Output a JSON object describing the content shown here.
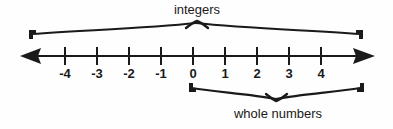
{
  "figure": {
    "title_top": "integers",
    "title_bottom": "whole numbers",
    "type": "number-line-diagram",
    "background_color": "#fefefe",
    "ink_color": "#1a1a1a"
  },
  "number_line": {
    "axis_y": 56,
    "left_arrow": "left-arrowhead",
    "right_arrow": "right-arrowhead",
    "ticks": [
      {
        "label": "-4",
        "value": -4,
        "x": 65
      },
      {
        "label": "-3",
        "value": -3,
        "x": 97
      },
      {
        "label": "-2",
        "value": -2,
        "x": 129
      },
      {
        "label": "-1",
        "value": -1,
        "x": 161
      },
      {
        "label": "0",
        "value": 0,
        "x": 193
      },
      {
        "label": "1",
        "value": 1,
        "x": 225
      },
      {
        "label": "2",
        "value": 2,
        "x": 257
      },
      {
        "label": "3",
        "value": 3,
        "x": 289
      },
      {
        "label": "4",
        "value": 4,
        "x": 321
      }
    ]
  },
  "braces": [
    {
      "name": "integers-brace",
      "label": "integers",
      "orientation": "up",
      "start_x": 29,
      "end_x": 363,
      "peak_x": 197,
      "label_x": 197,
      "covers": "all tick marks from -4 through 4 and beyond"
    },
    {
      "name": "whole-numbers-brace",
      "label": "whole numbers",
      "orientation": "down",
      "start_x": 189,
      "end_x": 364,
      "peak_x": 276,
      "label_x": 278,
      "covers": "0 through 4 and beyond"
    }
  ]
}
